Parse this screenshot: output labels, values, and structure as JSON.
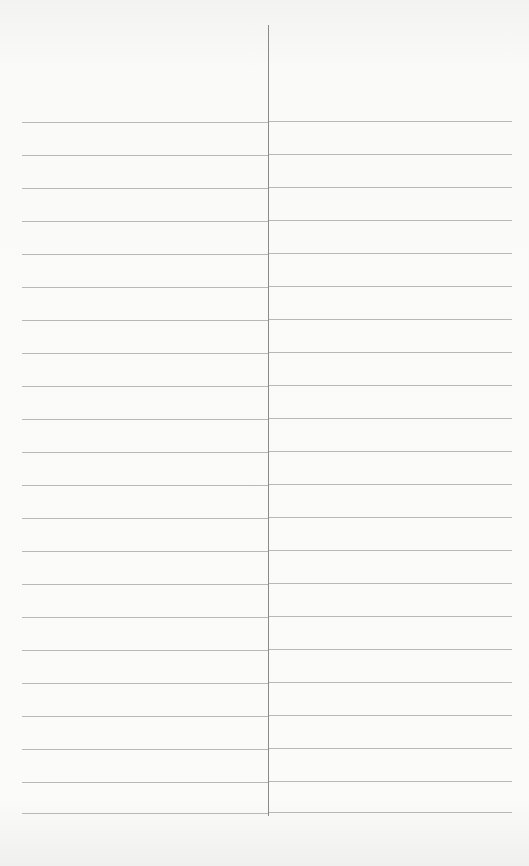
{
  "sheet": {
    "type": "two-column ruled sheet",
    "columns": 2,
    "divider_x": 268,
    "divider_top": 25,
    "divider_bottom": 816,
    "rule_color": "#b8b8b8",
    "divider_color": "#8a8a8a",
    "rule_positions": [
      122,
      155,
      188,
      221,
      254,
      287,
      320,
      353,
      386,
      419,
      452,
      485,
      518,
      551,
      584,
      617,
      650,
      683,
      716,
      749,
      782,
      813
    ],
    "left_column_entries": [],
    "right_column_entries": []
  }
}
